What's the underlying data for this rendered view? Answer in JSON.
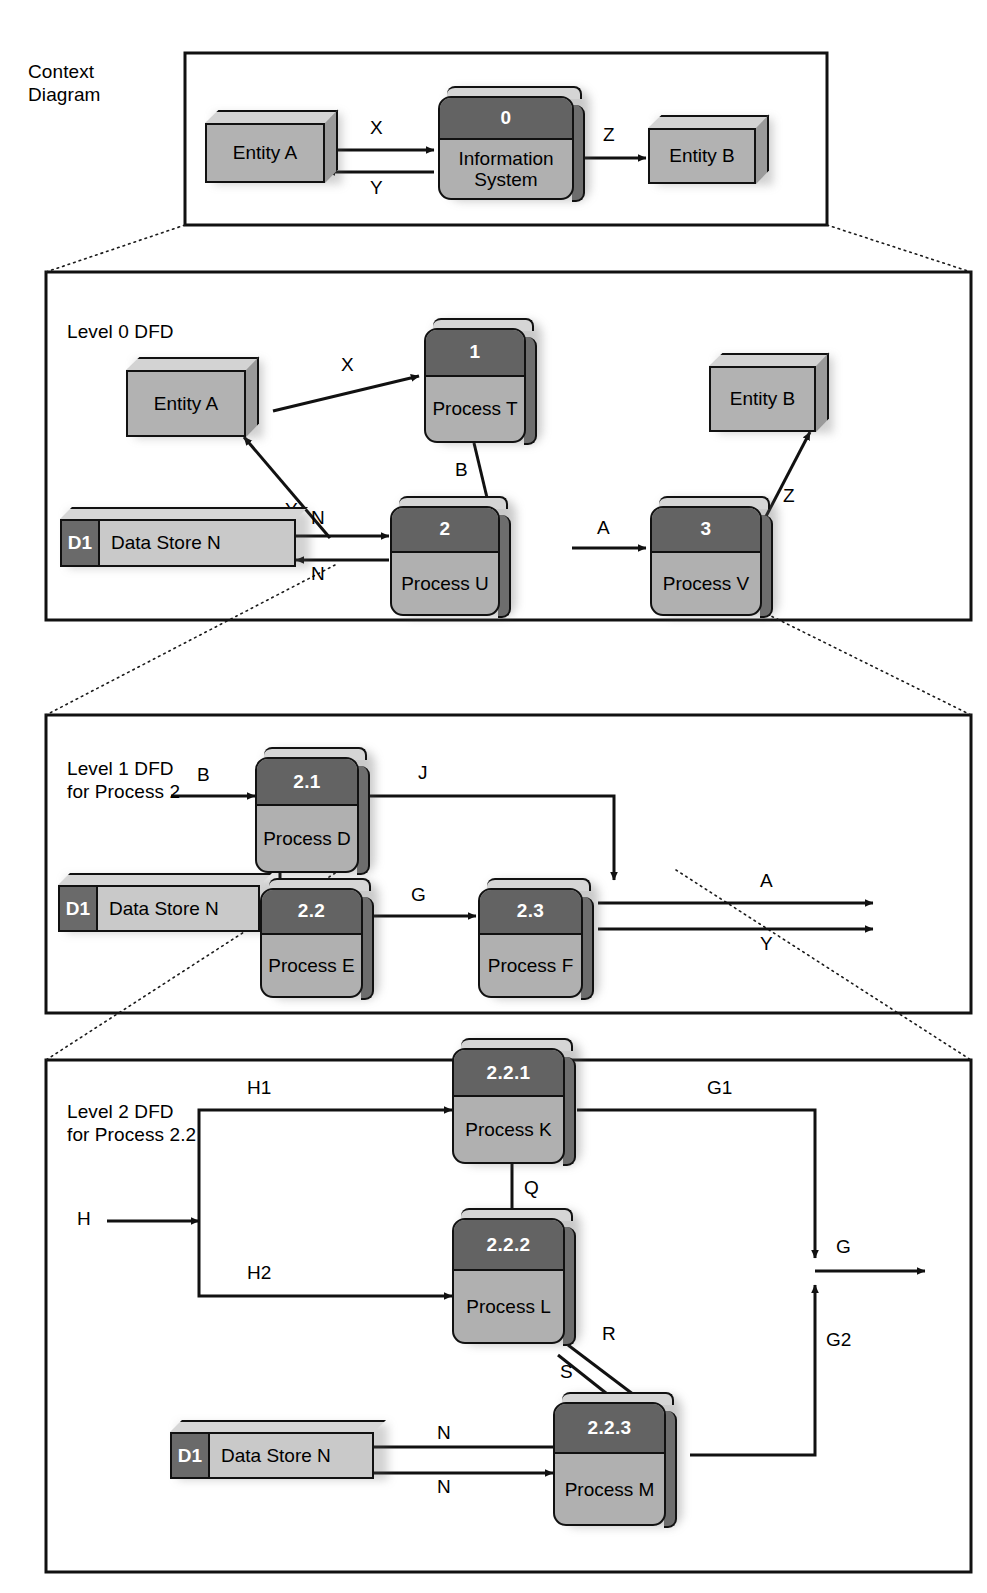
{
  "panels": [
    {
      "title": "Context\nDiagram",
      "x": 185,
      "y": 53,
      "w": 642,
      "h": 172
    },
    {
      "title": "Level 0 DFD",
      "x": 46,
      "y": 272,
      "w": 925,
      "h": 348
    },
    {
      "title": "Level 1 DFD\nfor Process 2",
      "x": 46,
      "y": 715,
      "w": 925,
      "h": 298
    },
    {
      "title": "Level 2 DFD\nfor Process 2.2",
      "x": 46,
      "y": 1060,
      "w": 925,
      "h": 512
    }
  ],
  "context": {
    "entity_a": "Entity A",
    "entity_b": "Entity B",
    "process_number": "0",
    "process_name": "Information\nSystem",
    "flows": {
      "x": "X",
      "y": "Y",
      "z": "Z"
    }
  },
  "level0": {
    "entity_a": "Entity A",
    "entity_b": "Entity B",
    "store_id": "D1",
    "store_name": "Data Store N",
    "processes": [
      {
        "number": "1",
        "name": "Process T"
      },
      {
        "number": "2",
        "name": "Process U"
      },
      {
        "number": "3",
        "name": "Process V"
      }
    ],
    "flows": {
      "x": "X",
      "y": "Y",
      "z": "Z",
      "a": "A",
      "b": "B",
      "n_in": "N",
      "n_out": "N"
    }
  },
  "level1": {
    "store_id": "D1",
    "store_name": "Data Store N",
    "processes": [
      {
        "number": "2.1",
        "name": "Process D"
      },
      {
        "number": "2.2",
        "name": "Process E"
      },
      {
        "number": "2.3",
        "name": "Process F"
      }
    ],
    "flows": {
      "b": "B",
      "j": "J",
      "h": "H",
      "g": "G",
      "a": "A",
      "y": "Y",
      "n_in": "N",
      "n_out": "N"
    }
  },
  "level2": {
    "store_id": "D1",
    "store_name": "Data Store N",
    "processes": [
      {
        "number": "2.2.1",
        "name": "Process K"
      },
      {
        "number": "2.2.2",
        "name": "Process L"
      },
      {
        "number": "2.2.3",
        "name": "Process M"
      }
    ],
    "flows": {
      "h": "H",
      "h1": "H1",
      "h2": "H2",
      "q": "Q",
      "g": "G",
      "g1": "G1",
      "g2": "G2",
      "r": "R",
      "s": "S",
      "n_in": "N",
      "n_out": "N"
    }
  },
  "colors": {
    "process_header": "#636363",
    "process_body": "#b0b0b0",
    "entity_face": "#b2b2b2",
    "store_body": "#c9c9c9",
    "store_id": "#6a6a6a",
    "outline": "#111111",
    "background": "#ffffff"
  }
}
